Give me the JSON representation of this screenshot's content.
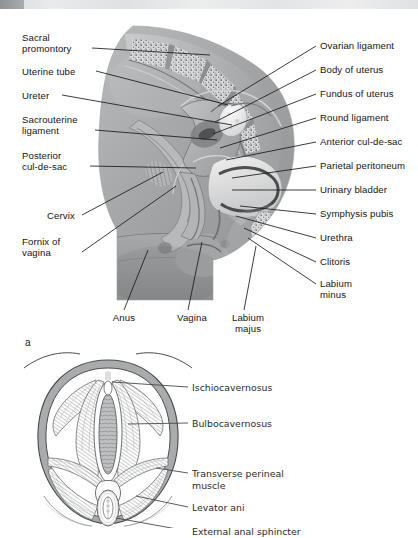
{
  "figure_a": {
    "letter": "a",
    "labels_left": [
      {
        "text": "Sacral\npromontory",
        "x": 22,
        "y": 22,
        "lx": 92,
        "ly": 38,
        "tx": 210,
        "ty": 45
      },
      {
        "text": "Uterine tube",
        "x": 22,
        "y": 56,
        "lx": 96,
        "ly": 61,
        "tx": 228,
        "ty": 95
      },
      {
        "text": "Ureter",
        "x": 22,
        "y": 80,
        "lx": 62,
        "ly": 85,
        "tx": 232,
        "ty": 115
      },
      {
        "text": "Sacrouterine\nligament",
        "x": 22,
        "y": 104,
        "lx": 95,
        "ly": 120,
        "tx": 217,
        "ty": 130
      },
      {
        "text": "Posterior\ncul-de-sac",
        "x": 22,
        "y": 140,
        "lx": 90,
        "ly": 156,
        "tx": 196,
        "ty": 158
      },
      {
        "text": "Cervix",
        "x": 47,
        "y": 200,
        "lx": 82,
        "ly": 205,
        "tx": 163,
        "ty": 162
      },
      {
        "text": "Fornix of\nvagina",
        "x": 22,
        "y": 226,
        "lx": 82,
        "ly": 242,
        "tx": 176,
        "ty": 176
      }
    ],
    "labels_right": [
      {
        "text": "Ovarian ligament",
        "x": 320,
        "y": 30,
        "lx": 316,
        "ly": 36,
        "tx": 218,
        "ty": 96
      },
      {
        "text": "Body of uterus",
        "x": 320,
        "y": 54,
        "lx": 316,
        "ly": 60,
        "tx": 215,
        "ty": 112
      },
      {
        "text": "Fundus of uterus",
        "x": 320,
        "y": 78,
        "lx": 316,
        "ly": 84,
        "tx": 213,
        "ty": 124
      },
      {
        "text": "Round ligament",
        "x": 320,
        "y": 102,
        "lx": 316,
        "ly": 108,
        "tx": 220,
        "ty": 138
      },
      {
        "text": "Anterior cul-de-sac",
        "x": 320,
        "y": 126,
        "lx": 316,
        "ly": 132,
        "tx": 226,
        "ty": 150
      },
      {
        "text": "Parietal peritoneum",
        "x": 320,
        "y": 150,
        "lx": 316,
        "ly": 156,
        "tx": 232,
        "ty": 168
      },
      {
        "text": "Urinary bladder",
        "x": 320,
        "y": 174,
        "lx": 316,
        "ly": 180,
        "tx": 232,
        "ty": 180
      },
      {
        "text": "Symphysis pubis",
        "x": 320,
        "y": 198,
        "lx": 316,
        "ly": 204,
        "tx": 240,
        "ty": 196
      },
      {
        "text": "Urethra",
        "x": 320,
        "y": 222,
        "lx": 316,
        "ly": 228,
        "tx": 236,
        "ty": 206
      },
      {
        "text": "Clitoris",
        "x": 320,
        "y": 246,
        "lx": 316,
        "ly": 252,
        "tx": 244,
        "ty": 218
      },
      {
        "text": "Labium\nminus",
        "x": 320,
        "y": 268,
        "lx": 316,
        "ly": 274,
        "tx": 248,
        "ty": 228
      }
    ],
    "labels_bottom": [
      {
        "text": "Anus",
        "x": 102,
        "y": 302,
        "lx": 124,
        "ly": 300,
        "tx": 148,
        "ty": 240
      },
      {
        "text": "Vagina",
        "x": 170,
        "y": 302,
        "lx": 188,
        "ly": 300,
        "tx": 202,
        "ty": 232
      },
      {
        "text": "Labium\nmajus",
        "x": 226,
        "y": 302,
        "lx": 244,
        "ly": 300,
        "tx": 256,
        "ty": 236
      }
    ]
  },
  "figure_b": {
    "labels": [
      {
        "text": "Ischiocavernosus",
        "x": 192,
        "y": 36,
        "lx": 188,
        "ly": 41,
        "tx": 112,
        "ty": 36
      },
      {
        "text": "Bulbocavernosus",
        "x": 192,
        "y": 72,
        "lx": 188,
        "ly": 77,
        "tx": 128,
        "ty": 78
      },
      {
        "text": "Transverse perineal\nmuscle",
        "x": 192,
        "y": 122,
        "lx": 188,
        "ly": 127,
        "tx": 156,
        "ty": 122
      },
      {
        "text": "Levator ani",
        "x": 192,
        "y": 156,
        "lx": 188,
        "ly": 161,
        "tx": 136,
        "ty": 150
      },
      {
        "text": "External anal sphincter",
        "x": 192,
        "y": 180,
        "lx": 188,
        "ly": 185,
        "tx": 116,
        "ty": 172
      }
    ]
  },
  "colors": {
    "leader_line": "#1a1a1a",
    "leader_line_b": "#4a4a4a",
    "rim_grey": "#a8aaac",
    "tissue_mid": "#9a9c9e",
    "tissue_light": "#d5d6d7",
    "tissue_dark": "#5e6062",
    "bone_speckle": "#6c6e70",
    "strip_block": "#8e9194"
  }
}
